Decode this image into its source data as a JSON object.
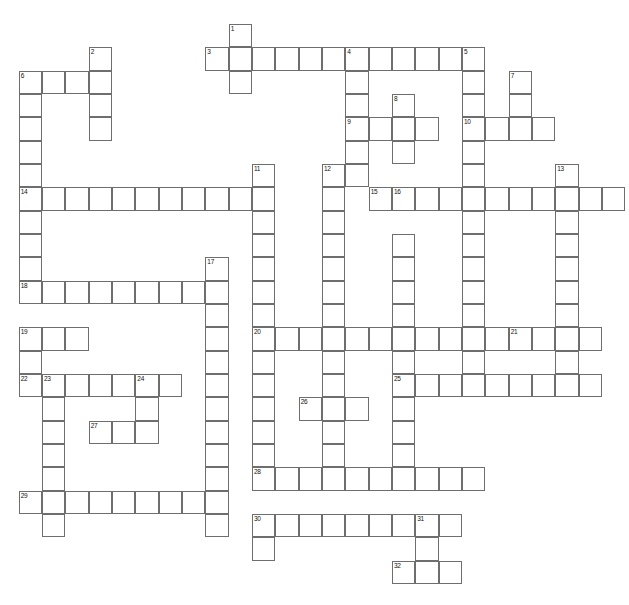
{
  "puzzle": {
    "title": "",
    "type": "crossword-grid",
    "grid_geometry": {
      "origin_x": 18.7,
      "origin_y": 24,
      "cell_size": 23.33,
      "cols": 26,
      "rows": 25,
      "border_color": "#6e6e6e",
      "cell_fill": "#ffffff",
      "number_font_size": 6.5
    },
    "entries": [
      {
        "number": "1",
        "direction": "down",
        "col": 9,
        "row": 0,
        "length": 3
      },
      {
        "number": "2",
        "direction": "down",
        "col": 3,
        "row": 1,
        "length": 4
      },
      {
        "number": "3",
        "direction": "across",
        "col": 8,
        "row": 1,
        "length": 12
      },
      {
        "number": "4",
        "direction": "down",
        "col": 14,
        "row": 1,
        "length": 6
      },
      {
        "number": "5",
        "direction": "down",
        "col": 19,
        "row": 1,
        "length": 9
      },
      {
        "number": "6",
        "direction": "across",
        "col": 0,
        "row": 2,
        "length": 4
      },
      {
        "number": "6",
        "direction": "down",
        "col": 0,
        "row": 2,
        "length": 13
      },
      {
        "number": "7",
        "direction": "down",
        "col": 21,
        "row": 2,
        "length": 3
      },
      {
        "number": "8",
        "direction": "down",
        "col": 16,
        "row": 3,
        "length": 3
      },
      {
        "number": "9",
        "direction": "across",
        "col": 14,
        "row": 4,
        "length": 4
      },
      {
        "number": "10",
        "direction": "across",
        "col": 19,
        "row": 4,
        "length": 4
      },
      {
        "number": "11",
        "direction": "down",
        "col": 10,
        "row": 6,
        "length": 10
      },
      {
        "number": "12",
        "direction": "down",
        "col": 13,
        "row": 6,
        "length": 10
      },
      {
        "number": "13",
        "direction": "down",
        "col": 23,
        "row": 6,
        "length": 8
      },
      {
        "number": "14",
        "direction": "across",
        "col": 0,
        "row": 7,
        "length": 11
      },
      {
        "number": "15",
        "direction": "across",
        "col": 15,
        "row": 7,
        "length": 11
      },
      {
        "number": "16",
        "direction": "down",
        "col": 16,
        "row": 7,
        "length": 9
      },
      {
        "number": "17",
        "direction": "down",
        "col": 8,
        "row": 10,
        "length": 11
      },
      {
        "number": "18",
        "direction": "across",
        "col": 0,
        "row": 11,
        "length": 8
      },
      {
        "number": "19",
        "direction": "across",
        "col": 0,
        "row": 13,
        "length": 3
      },
      {
        "number": "19",
        "direction": "down",
        "col": 0,
        "row": 13,
        "length": 3
      },
      {
        "number": "20",
        "direction": "across",
        "col": 10,
        "row": 13,
        "length": 11
      },
      {
        "number": "21",
        "direction": "across",
        "col": 21,
        "row": 13,
        "length": 4
      },
      {
        "number": "22",
        "direction": "across",
        "col": 0,
        "row": 15,
        "length": 7
      },
      {
        "number": "23",
        "direction": "down",
        "col": 1,
        "row": 15,
        "length": 8
      },
      {
        "number": "24",
        "direction": "down",
        "col": 5,
        "row": 15,
        "length": 3
      },
      {
        "number": "25",
        "direction": "across",
        "col": 16,
        "row": 15,
        "length": 9
      },
      {
        "number": "26",
        "direction": "across",
        "col": 12,
        "row": 16,
        "length": 3
      },
      {
        "number": "26",
        "direction": "down",
        "col": 12,
        "row": 16,
        "length": 2
      },
      {
        "number": "27",
        "direction": "across",
        "col": 3,
        "row": 17,
        "length": 3
      },
      {
        "number": "28",
        "direction": "across",
        "col": 10,
        "row": 19,
        "length": 10
      },
      {
        "number": "29",
        "direction": "across",
        "col": 0,
        "row": 20,
        "length": 8
      },
      {
        "number": "30",
        "direction": "across",
        "col": 10,
        "row": 21,
        "length": 9
      },
      {
        "number": "31",
        "direction": "down",
        "col": 17,
        "row": 21,
        "length": 3
      },
      {
        "number": "32",
        "direction": "across",
        "col": 16,
        "row": 23,
        "length": 3
      }
    ],
    "cells": [
      {
        "c": 9,
        "r": 0,
        "n": "1"
      },
      {
        "c": 3,
        "r": 1,
        "n": "2"
      },
      {
        "c": 8,
        "r": 1,
        "n": "3"
      },
      {
        "c": 9,
        "r": 1
      },
      {
        "c": 10,
        "r": 1
      },
      {
        "c": 11,
        "r": 1
      },
      {
        "c": 12,
        "r": 1
      },
      {
        "c": 13,
        "r": 1
      },
      {
        "c": 14,
        "r": 1,
        "n": "4"
      },
      {
        "c": 15,
        "r": 1
      },
      {
        "c": 16,
        "r": 1
      },
      {
        "c": 17,
        "r": 1
      },
      {
        "c": 18,
        "r": 1
      },
      {
        "c": 19,
        "r": 1,
        "n": "5"
      },
      {
        "c": 3,
        "r": 2
      },
      {
        "c": 9,
        "r": 2
      },
      {
        "c": 14,
        "r": 2
      },
      {
        "c": 19,
        "r": 2
      },
      {
        "c": 21,
        "r": 2,
        "n": "7"
      },
      {
        "c": 0,
        "r": 2,
        "n": "6"
      },
      {
        "c": 1,
        "r": 2
      },
      {
        "c": 2,
        "r": 2
      },
      {
        "c": 0,
        "r": 3
      },
      {
        "c": 3,
        "r": 3
      },
      {
        "c": 14,
        "r": 3
      },
      {
        "c": 16,
        "r": 3,
        "n": "8"
      },
      {
        "c": 19,
        "r": 3
      },
      {
        "c": 21,
        "r": 3
      },
      {
        "c": 0,
        "r": 4
      },
      {
        "c": 3,
        "r": 4
      },
      {
        "c": 14,
        "r": 4,
        "n": "9"
      },
      {
        "c": 15,
        "r": 4
      },
      {
        "c": 16,
        "r": 4
      },
      {
        "c": 17,
        "r": 4
      },
      {
        "c": 19,
        "r": 4,
        "n": "10"
      },
      {
        "c": 20,
        "r": 4
      },
      {
        "c": 21,
        "r": 4
      },
      {
        "c": 22,
        "r": 4
      },
      {
        "c": 0,
        "r": 5
      },
      {
        "c": 14,
        "r": 5
      },
      {
        "c": 16,
        "r": 5
      },
      {
        "c": 19,
        "r": 5
      },
      {
        "c": 0,
        "r": 6
      },
      {
        "c": 10,
        "r": 6,
        "n": "11"
      },
      {
        "c": 13,
        "r": 6,
        "n": "12"
      },
      {
        "c": 14,
        "r": 6
      },
      {
        "c": 19,
        "r": 6
      },
      {
        "c": 23,
        "r": 6,
        "n": "13"
      },
      {
        "c": 0,
        "r": 7,
        "n": "14"
      },
      {
        "c": 1,
        "r": 7
      },
      {
        "c": 2,
        "r": 7
      },
      {
        "c": 3,
        "r": 7
      },
      {
        "c": 4,
        "r": 7
      },
      {
        "c": 5,
        "r": 7
      },
      {
        "c": 6,
        "r": 7
      },
      {
        "c": 7,
        "r": 7
      },
      {
        "c": 8,
        "r": 7
      },
      {
        "c": 9,
        "r": 7
      },
      {
        "c": 10,
        "r": 7
      },
      {
        "c": 13,
        "r": 7
      },
      {
        "c": 15,
        "r": 7,
        "n": "15"
      },
      {
        "c": 16,
        "r": 7,
        "n": "16"
      },
      {
        "c": 17,
        "r": 7
      },
      {
        "c": 18,
        "r": 7
      },
      {
        "c": 19,
        "r": 7
      },
      {
        "c": 20,
        "r": 7
      },
      {
        "c": 21,
        "r": 7
      },
      {
        "c": 22,
        "r": 7
      },
      {
        "c": 23,
        "r": 7
      },
      {
        "c": 24,
        "r": 7
      },
      {
        "c": 25,
        "r": 7
      },
      {
        "c": 0,
        "r": 8
      },
      {
        "c": 10,
        "r": 8
      },
      {
        "c": 13,
        "r": 8
      },
      {
        "c": 19,
        "r": 8
      },
      {
        "c": 23,
        "r": 8
      },
      {
        "c": 0,
        "r": 9
      },
      {
        "c": 10,
        "r": 9
      },
      {
        "c": 13,
        "r": 9
      },
      {
        "c": 16,
        "r": 9
      },
      {
        "c": 19,
        "r": 9
      },
      {
        "c": 23,
        "r": 9
      },
      {
        "c": 0,
        "r": 10
      },
      {
        "c": 8,
        "r": 10,
        "n": "17"
      },
      {
        "c": 10,
        "r": 10
      },
      {
        "c": 13,
        "r": 10
      },
      {
        "c": 16,
        "r": 10
      },
      {
        "c": 19,
        "r": 10
      },
      {
        "c": 23,
        "r": 10
      },
      {
        "c": 0,
        "r": 11,
        "n": "18"
      },
      {
        "c": 1,
        "r": 11
      },
      {
        "c": 2,
        "r": 11
      },
      {
        "c": 3,
        "r": 11
      },
      {
        "c": 4,
        "r": 11
      },
      {
        "c": 5,
        "r": 11
      },
      {
        "c": 6,
        "r": 11
      },
      {
        "c": 7,
        "r": 11
      },
      {
        "c": 8,
        "r": 11
      },
      {
        "c": 10,
        "r": 11
      },
      {
        "c": 13,
        "r": 11
      },
      {
        "c": 16,
        "r": 11
      },
      {
        "c": 19,
        "r": 11
      },
      {
        "c": 23,
        "r": 11
      },
      {
        "c": 8,
        "r": 12
      },
      {
        "c": 10,
        "r": 12
      },
      {
        "c": 13,
        "r": 12
      },
      {
        "c": 16,
        "r": 12
      },
      {
        "c": 19,
        "r": 12
      },
      {
        "c": 23,
        "r": 12
      },
      {
        "c": 0,
        "r": 13,
        "n": "19"
      },
      {
        "c": 1,
        "r": 13
      },
      {
        "c": 2,
        "r": 13
      },
      {
        "c": 8,
        "r": 13
      },
      {
        "c": 10,
        "r": 13,
        "n": "20"
      },
      {
        "c": 11,
        "r": 13
      },
      {
        "c": 12,
        "r": 13
      },
      {
        "c": 13,
        "r": 13
      },
      {
        "c": 14,
        "r": 13
      },
      {
        "c": 15,
        "r": 13
      },
      {
        "c": 16,
        "r": 13
      },
      {
        "c": 17,
        "r": 13
      },
      {
        "c": 18,
        "r": 13
      },
      {
        "c": 19,
        "r": 13
      },
      {
        "c": 20,
        "r": 13
      },
      {
        "c": 21,
        "r": 13,
        "n": "21"
      },
      {
        "c": 22,
        "r": 13
      },
      {
        "c": 23,
        "r": 13
      },
      {
        "c": 24,
        "r": 13
      },
      {
        "c": 0,
        "r": 14
      },
      {
        "c": 8,
        "r": 14
      },
      {
        "c": 10,
        "r": 14
      },
      {
        "c": 13,
        "r": 14
      },
      {
        "c": 16,
        "r": 14
      },
      {
        "c": 19,
        "r": 14
      },
      {
        "c": 23,
        "r": 14
      },
      {
        "c": 0,
        "r": 15,
        "n": "22"
      },
      {
        "c": 1,
        "r": 15,
        "n": "23"
      },
      {
        "c": 2,
        "r": 15
      },
      {
        "c": 3,
        "r": 15
      },
      {
        "c": 4,
        "r": 15
      },
      {
        "c": 5,
        "r": 15,
        "n": "24"
      },
      {
        "c": 6,
        "r": 15
      },
      {
        "c": 8,
        "r": 15
      },
      {
        "c": 10,
        "r": 15
      },
      {
        "c": 13,
        "r": 15
      },
      {
        "c": 16,
        "r": 15,
        "n": "25"
      },
      {
        "c": 17,
        "r": 15
      },
      {
        "c": 18,
        "r": 15
      },
      {
        "c": 19,
        "r": 15
      },
      {
        "c": 20,
        "r": 15
      },
      {
        "c": 21,
        "r": 15
      },
      {
        "c": 22,
        "r": 15
      },
      {
        "c": 23,
        "r": 15
      },
      {
        "c": 24,
        "r": 15
      },
      {
        "c": 1,
        "r": 16
      },
      {
        "c": 5,
        "r": 16
      },
      {
        "c": 8,
        "r": 16
      },
      {
        "c": 10,
        "r": 16
      },
      {
        "c": 12,
        "r": 16,
        "n": "26"
      },
      {
        "c": 13,
        "r": 16
      },
      {
        "c": 14,
        "r": 16
      },
      {
        "c": 16,
        "r": 16
      },
      {
        "c": 1,
        "r": 17
      },
      {
        "c": 3,
        "r": 17,
        "n": "27"
      },
      {
        "c": 4,
        "r": 17
      },
      {
        "c": 5,
        "r": 17
      },
      {
        "c": 8,
        "r": 17
      },
      {
        "c": 10,
        "r": 17
      },
      {
        "c": 13,
        "r": 17
      },
      {
        "c": 16,
        "r": 17
      },
      {
        "c": 1,
        "r": 18
      },
      {
        "c": 8,
        "r": 18
      },
      {
        "c": 10,
        "r": 18
      },
      {
        "c": 13,
        "r": 18
      },
      {
        "c": 16,
        "r": 18
      },
      {
        "c": 1,
        "r": 19
      },
      {
        "c": 8,
        "r": 19
      },
      {
        "c": 10,
        "r": 19,
        "n": "28"
      },
      {
        "c": 11,
        "r": 19
      },
      {
        "c": 12,
        "r": 19
      },
      {
        "c": 13,
        "r": 19
      },
      {
        "c": 14,
        "r": 19
      },
      {
        "c": 15,
        "r": 19
      },
      {
        "c": 16,
        "r": 19
      },
      {
        "c": 17,
        "r": 19
      },
      {
        "c": 18,
        "r": 19
      },
      {
        "c": 19,
        "r": 19
      },
      {
        "c": 0,
        "r": 20,
        "n": "29"
      },
      {
        "c": 1,
        "r": 20
      },
      {
        "c": 2,
        "r": 20
      },
      {
        "c": 3,
        "r": 20
      },
      {
        "c": 4,
        "r": 20
      },
      {
        "c": 5,
        "r": 20
      },
      {
        "c": 6,
        "r": 20
      },
      {
        "c": 7,
        "r": 20
      },
      {
        "c": 8,
        "r": 20
      },
      {
        "c": 1,
        "r": 21
      },
      {
        "c": 8,
        "r": 21
      },
      {
        "c": 10,
        "r": 21,
        "n": "30"
      },
      {
        "c": 11,
        "r": 21
      },
      {
        "c": 12,
        "r": 21
      },
      {
        "c": 13,
        "r": 21
      },
      {
        "c": 14,
        "r": 21
      },
      {
        "c": 15,
        "r": 21
      },
      {
        "c": 16,
        "r": 21
      },
      {
        "c": 17,
        "r": 21,
        "n": "31"
      },
      {
        "c": 18,
        "r": 21
      },
      {
        "c": 10,
        "r": 22
      },
      {
        "c": 17,
        "r": 22
      },
      {
        "c": 16,
        "r": 23,
        "n": "32"
      },
      {
        "c": 17,
        "r": 23
      },
      {
        "c": 18,
        "r": 23
      }
    ]
  }
}
